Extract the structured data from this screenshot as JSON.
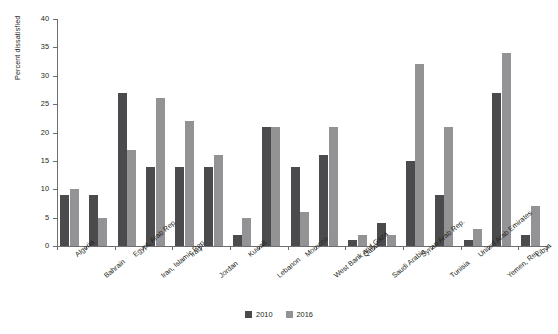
{
  "chart_data": {
    "type": "bar",
    "title": "",
    "subtitle": "",
    "xlabel": "",
    "ylabel": "Percent dissatisfied",
    "ylim": [
      0,
      40
    ],
    "yticks": [
      0,
      5,
      10,
      15,
      20,
      25,
      30,
      35,
      40
    ],
    "grid": false,
    "legend_position": "bottom-center",
    "categories": [
      "Algeria",
      "Bahrain",
      "Egypt, Arab Rep.",
      "Iran, Islamic Rep.",
      "Iraq",
      "Jordan",
      "Kuwait",
      "Lebanon",
      "Morocco",
      "West Bank and Gaza",
      "Qatar",
      "Saudi Arabia",
      "Syrian Arab Rep.",
      "Tunisia",
      "United Arab Emirates",
      "Yemen, Rep.",
      "Libya"
    ],
    "series": [
      {
        "name": "2010",
        "color": "#4b4b4d",
        "values": [
          9,
          9,
          27,
          14,
          14,
          14,
          2,
          21,
          14,
          16,
          1,
          4,
          15,
          9,
          1,
          27,
          2
        ]
      },
      {
        "name": "2016",
        "color": "#939396",
        "values": [
          10,
          5,
          17,
          26,
          22,
          16,
          5,
          21,
          6,
          21,
          2,
          2,
          32,
          21,
          3,
          34,
          7
        ]
      }
    ]
  },
  "legend": {
    "items": [
      {
        "label": "2010",
        "color": "#4b4b4d"
      },
      {
        "label": "2016",
        "color": "#939396"
      }
    ]
  }
}
